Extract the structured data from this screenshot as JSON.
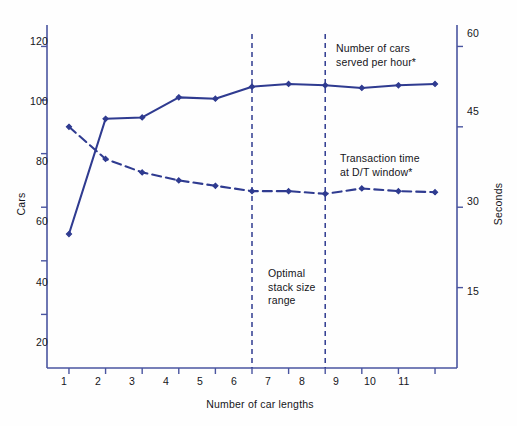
{
  "chart_data": {
    "type": "line",
    "title": "",
    "xlabel": "Number of car lengths",
    "ylabel": "Cars",
    "y2label": "Seconds",
    "grid": false,
    "legend_position": "inline-annotations",
    "x": [
      1,
      2,
      3,
      4,
      5,
      6,
      7,
      8,
      9,
      10,
      11
    ],
    "xtick_labels": [
      "1",
      "2",
      "3",
      "4",
      "5",
      "6",
      "7",
      "8",
      "9",
      "10",
      "11"
    ],
    "xlim": [
      0.4,
      11.6
    ],
    "ylim": [
      0,
      128
    ],
    "ytick_labels": [
      "20",
      "40",
      "60",
      "80",
      "100",
      "120"
    ],
    "yticks": [
      20,
      40,
      60,
      80,
      100,
      120
    ],
    "y2lim": [
      0,
      64
    ],
    "y2tick_labels": [
      "15",
      "30",
      "45",
      "60"
    ],
    "y2ticks": [
      15,
      30,
      45,
      60
    ],
    "series": [
      {
        "name": "Number of cars served per hour*",
        "axis": "left",
        "style": "solid",
        "color": "#2f3b90",
        "marker": "diamond",
        "values": [
          50,
          93,
          93.5,
          101,
          100.5,
          105,
          106,
          105.5,
          104.5,
          105.5,
          106
        ]
      },
      {
        "name": "Transaction time at D/T window*",
        "axis": "right",
        "style": "dashed",
        "color": "#2f3b90",
        "marker": "diamond",
        "values": [
          45,
          39,
          36.5,
          35,
          34,
          33,
          33,
          32.5,
          33.5,
          33,
          32.8
        ]
      }
    ],
    "annotations": [
      {
        "name": "cars-served-label",
        "text": "Number of cars\nserved per hour*",
        "x_px": 336,
        "y_px": 42
      },
      {
        "name": "transaction-time-label",
        "text": "Transaction time\nat D/T window*",
        "x_px": 340,
        "y_px": 152
      },
      {
        "name": "optimal-range-label",
        "text": "Optimal\nstack size\nrange",
        "x_px": 268,
        "y_px": 267
      }
    ],
    "vlines": [
      {
        "name": "optimal-range-start",
        "x": 6,
        "style": "dashed",
        "color": "#2f3b90"
      },
      {
        "name": "optimal-range-end",
        "x": 8,
        "style": "dashed",
        "color": "#2f3b90"
      }
    ],
    "colors": {
      "series": "#2f3b90",
      "axis": "#4a55a0",
      "text": "#15151a",
      "background": "#fefefe"
    }
  }
}
